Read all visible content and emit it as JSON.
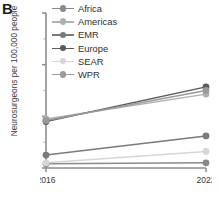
{
  "panel": {
    "label": "B"
  },
  "axes": {
    "ylabel": "Neurosurgeons per 100,000 people",
    "yticks": [
      "0",
      "1",
      "2",
      "3"
    ],
    "xticks": [
      "2016",
      "2022"
    ]
  },
  "legend": {
    "position": "top-left-inside",
    "items": [
      {
        "label": "Africa",
        "color": "#8a8a8a"
      },
      {
        "label": "Americas",
        "color": "#b0b0b0"
      },
      {
        "label": "EMR",
        "color": "#7a7a7a"
      },
      {
        "label": "Europe",
        "color": "#5a5a5a"
      },
      {
        "label": "SEAR",
        "color": "#d6d6d6"
      },
      {
        "label": "WPR",
        "color": "#9a9a9a"
      }
    ]
  },
  "chart_data": {
    "type": "line",
    "title": "",
    "xlabel": "",
    "ylabel": "Neurosurgeons per 100,000 people",
    "x": [
      "2016",
      "2022"
    ],
    "ylim": [
      0,
      3
    ],
    "yticks": [
      0,
      1,
      2,
      3
    ],
    "grid": false,
    "legend_position": "top-left-inside",
    "series": [
      {
        "name": "Africa",
        "color": "#8a8a8a",
        "values": [
          0.08,
          0.1
        ]
      },
      {
        "name": "Americas",
        "color": "#b0b0b0",
        "values": [
          0.95,
          1.43
        ]
      },
      {
        "name": "EMR",
        "color": "#7a7a7a",
        "values": [
          0.25,
          0.62
        ]
      },
      {
        "name": "Europe",
        "color": "#5a5a5a",
        "values": [
          0.9,
          1.57
        ]
      },
      {
        "name": "SEAR",
        "color": "#d6d6d6",
        "values": [
          0.1,
          0.32
        ]
      },
      {
        "name": "WPR",
        "color": "#9a9a9a",
        "values": [
          0.92,
          1.5
        ]
      }
    ]
  }
}
